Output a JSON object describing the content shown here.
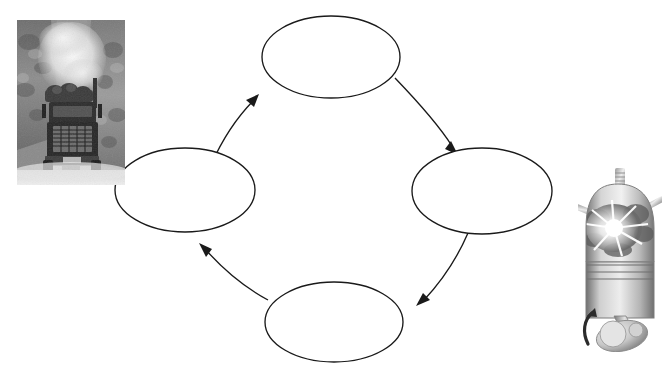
{
  "page": {
    "background_color": "#ffffff",
    "width": 664,
    "height": 377,
    "top_clipped_text": "·    ·    ·    ·    ·    ·"
  },
  "diagram": {
    "type": "cycle",
    "direction": "clockwise",
    "stroke_color": "#1a1a1a",
    "node_fill_color": "#ffffff",
    "nodes": [
      {
        "id": "node-top",
        "label": "",
        "cx": 331,
        "cy": 57,
        "rx": 69,
        "ry": 41
      },
      {
        "id": "node-right",
        "label": "",
        "cx": 482,
        "cy": 191,
        "rx": 70,
        "ry": 43
      },
      {
        "id": "node-bottom",
        "label": "",
        "cx": 334,
        "cy": 322,
        "rx": 69,
        "ry": 40
      },
      {
        "id": "node-left",
        "label": "",
        "cx": 185,
        "cy": 190,
        "rx": 70,
        "ry": 42
      }
    ],
    "arrows": [
      {
        "id": "arrow-left-to-top",
        "from": "node-left",
        "to": "node-top",
        "label": ""
      },
      {
        "id": "arrow-top-to-right",
        "from": "node-top",
        "to": "node-right",
        "label": ""
      },
      {
        "id": "arrow-right-to-bottom",
        "from": "node-right",
        "to": "node-bottom",
        "label": ""
      },
      {
        "id": "arrow-bottom-to-left",
        "from": "node-bottom",
        "to": "node-left",
        "label": ""
      }
    ]
  },
  "images": {
    "truck_photo": {
      "name": "logging-truck-photo",
      "description": "Black and white photograph of a logging truck with exhaust smoke",
      "style": "grayscale",
      "x": 17,
      "y": 20,
      "width": 108,
      "height": 165
    },
    "engine_illustration": {
      "name": "engine-cylinder-illustration",
      "description": "Grayscale cutaway illustration of an engine cylinder with spark plug, combustion flash, piston, connecting rod and crankshaft with rotation arrow",
      "style": "grayscale",
      "x": 578,
      "y": 166,
      "width": 84,
      "height": 186,
      "rotation_arrow_direction": "counterclockwise"
    }
  },
  "colors": {
    "line": "#1a1a1a",
    "background": "#ffffff",
    "photo_tone": "#8a8a8a",
    "engine_tone": "#a9a9a9"
  }
}
